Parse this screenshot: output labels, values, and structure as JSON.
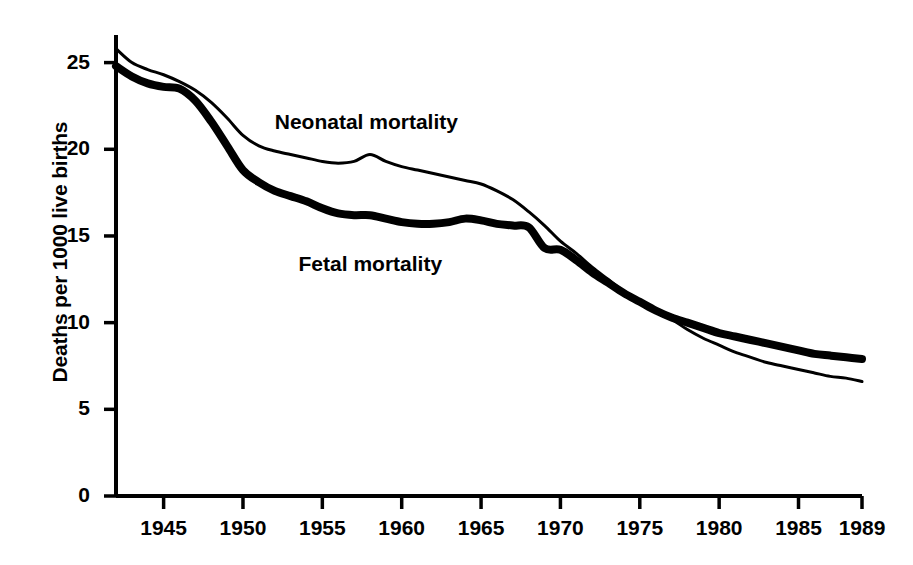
{
  "chart_data": {
    "type": "line",
    "title": "",
    "subtitle": "",
    "xlabel": "",
    "ylabel": "Deaths per 1000 live births",
    "xlim": [
      1942,
      1989
    ],
    "ylim": [
      0,
      26.5
    ],
    "grid": false,
    "legend_position": "inline-annotation",
    "x_ticks": [
      "1945",
      "1950",
      "1955",
      "1960",
      "1965",
      "1970",
      "1975",
      "1980",
      "1985",
      "1989"
    ],
    "x_tick_values": [
      1945,
      1950,
      1955,
      1960,
      1965,
      1970,
      1975,
      1980,
      1985,
      1989
    ],
    "y_ticks": [
      "0",
      "5",
      "10",
      "15",
      "20",
      "25"
    ],
    "y_tick_values": [
      0,
      5,
      10,
      15,
      20,
      25
    ],
    "annotations": [
      {
        "text": "Neonatal mortality",
        "x": 1952.0,
        "y": 21.5
      },
      {
        "text": "Fetal mortality",
        "x": 1953.5,
        "y": 13.3
      }
    ],
    "series": [
      {
        "name": "Neonatal mortality",
        "style": "thin",
        "line_width": 3,
        "color": "#000000",
        "x": [
          1942,
          1943,
          1944,
          1945,
          1946,
          1947,
          1948,
          1949,
          1950,
          1951,
          1952,
          1953,
          1954,
          1955,
          1956,
          1957,
          1958,
          1959,
          1960,
          1961,
          1962,
          1963,
          1964,
          1965,
          1966,
          1967,
          1968,
          1969,
          1970,
          1971,
          1972,
          1973,
          1974,
          1975,
          1976,
          1977,
          1978,
          1979,
          1980,
          1981,
          1982,
          1983,
          1984,
          1985,
          1986,
          1987,
          1988,
          1989
        ],
        "y": [
          25.8,
          25.0,
          24.6,
          24.3,
          23.9,
          23.4,
          22.7,
          21.8,
          20.8,
          20.2,
          19.9,
          19.7,
          19.5,
          19.3,
          19.2,
          19.3,
          19.7,
          19.3,
          19.0,
          18.8,
          18.6,
          18.4,
          18.2,
          18.0,
          17.6,
          17.1,
          16.4,
          15.6,
          14.7,
          14.0,
          13.2,
          12.5,
          11.8,
          11.2,
          10.7,
          10.2,
          9.6,
          9.1,
          8.7,
          8.3,
          8.0,
          7.7,
          7.5,
          7.3,
          7.1,
          6.9,
          6.8,
          6.6
        ]
      },
      {
        "name": "Fetal mortality",
        "style": "thick",
        "line_width": 8,
        "color": "#000000",
        "x": [
          1942,
          1943,
          1944,
          1945,
          1946,
          1947,
          1948,
          1949,
          1950,
          1951,
          1952,
          1953,
          1954,
          1955,
          1956,
          1957,
          1958,
          1959,
          1960,
          1961,
          1962,
          1963,
          1964,
          1965,
          1966,
          1967,
          1968,
          1969,
          1970,
          1971,
          1972,
          1973,
          1974,
          1975,
          1976,
          1977,
          1978,
          1979,
          1980,
          1981,
          1982,
          1983,
          1984,
          1985,
          1986,
          1987,
          1988,
          1989
        ],
        "y": [
          24.8,
          24.2,
          23.8,
          23.6,
          23.5,
          22.8,
          21.6,
          20.2,
          18.8,
          18.1,
          17.6,
          17.3,
          17.0,
          16.6,
          16.3,
          16.2,
          16.2,
          16.0,
          15.8,
          15.7,
          15.7,
          15.8,
          16.0,
          15.9,
          15.7,
          15.6,
          15.5,
          14.3,
          14.2,
          13.6,
          12.9,
          12.3,
          11.7,
          11.2,
          10.7,
          10.3,
          10.0,
          9.7,
          9.4,
          9.2,
          9.0,
          8.8,
          8.6,
          8.4,
          8.2,
          8.1,
          8.0,
          7.9
        ]
      }
    ]
  },
  "axis": {
    "y_title": "Deaths per 1000 live births"
  }
}
